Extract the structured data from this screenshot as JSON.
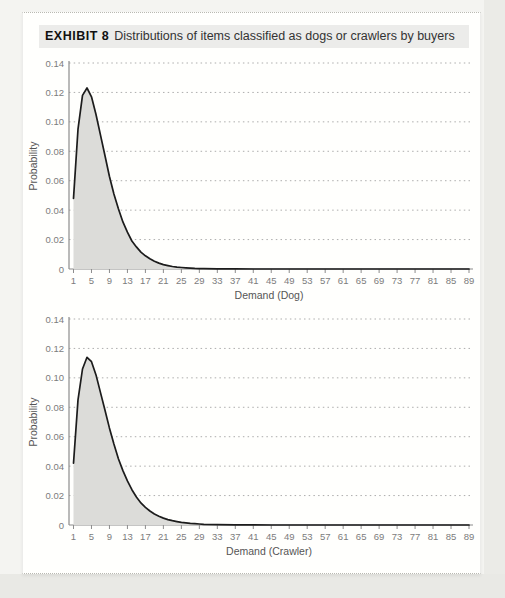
{
  "page": {
    "background": "#f4f4f1",
    "card_background": "#fffffd",
    "margin_band_color": "#e9e9e5"
  },
  "header": {
    "exhibit_label": "EXHIBIT 8",
    "title_rest": "Distributions of items classified as dogs or crawlers by buyers",
    "highlight_color": "#ececea"
  },
  "chart_data": [
    {
      "type": "area",
      "name": "dog-distribution",
      "xlabel": "Demand (Dog)",
      "ylabel": "Probability",
      "xlim": [
        0,
        89
      ],
      "ylim": [
        0,
        0.14
      ],
      "grid": "dotted-horizontal",
      "legend": "none",
      "x_ticks": [
        1,
        5,
        9,
        13,
        17,
        21,
        25,
        29,
        33,
        37,
        41,
        45,
        49,
        53,
        57,
        61,
        65,
        69,
        73,
        77,
        81,
        85,
        89
      ],
      "y_ticks": [
        0,
        0.02,
        0.04,
        0.06,
        0.08,
        0.1,
        0.12,
        0.14
      ],
      "y_tick_labels": [
        "0",
        "0.02",
        "0.04",
        "0.06",
        "0.08",
        "0.10",
        "0.12",
        "0.14"
      ],
      "x": [
        1,
        2,
        3,
        4,
        5,
        6,
        7,
        8,
        9,
        10,
        11,
        12,
        13,
        14,
        15,
        16,
        17,
        18,
        19,
        20,
        21,
        22,
        23,
        24,
        25,
        26,
        27,
        28,
        29,
        30,
        33,
        37,
        41,
        45,
        53,
        61,
        69,
        77,
        85,
        89
      ],
      "values": [
        0.048,
        0.095,
        0.118,
        0.123,
        0.117,
        0.105,
        0.091,
        0.077,
        0.063,
        0.051,
        0.041,
        0.032,
        0.025,
        0.019,
        0.015,
        0.0115,
        0.009,
        0.007,
        0.0053,
        0.004,
        0.003,
        0.0023,
        0.0017,
        0.0013,
        0.001,
        0.0008,
        0.0006,
        0.0004,
        0.0003,
        0.0002,
        0.0001,
        0.0001,
        0,
        0,
        0,
        0,
        0,
        0,
        0,
        0
      ],
      "line_color": "#1c1c1c",
      "fill_color": "#dcdcd9",
      "axis_color": "#8c8c8c",
      "grid_color": "#adadad"
    },
    {
      "type": "area",
      "name": "crawler-distribution",
      "xlabel": "Demand (Crawler)",
      "ylabel": "Probability",
      "xlim": [
        0,
        89
      ],
      "ylim": [
        0,
        0.14
      ],
      "grid": "dotted-horizontal",
      "legend": "none",
      "x_ticks": [
        1,
        5,
        9,
        13,
        17,
        21,
        25,
        29,
        33,
        37,
        41,
        45,
        49,
        53,
        57,
        61,
        65,
        69,
        73,
        77,
        81,
        85,
        89
      ],
      "y_ticks": [
        0,
        0.02,
        0.04,
        0.06,
        0.08,
        0.1,
        0.12,
        0.14
      ],
      "y_tick_labels": [
        "0",
        "0.02",
        "0.04",
        "0.06",
        "0.08",
        "0.10",
        "0.12",
        "0.14"
      ],
      "x": [
        1,
        2,
        3,
        4,
        5,
        6,
        7,
        8,
        9,
        10,
        11,
        12,
        13,
        14,
        15,
        16,
        17,
        18,
        19,
        20,
        21,
        22,
        23,
        24,
        25,
        26,
        27,
        28,
        29,
        30,
        33,
        37,
        41,
        45,
        53,
        61,
        69,
        77,
        85,
        89
      ],
      "values": [
        0.042,
        0.085,
        0.106,
        0.114,
        0.111,
        0.102,
        0.09,
        0.078,
        0.066,
        0.055,
        0.045,
        0.037,
        0.03,
        0.024,
        0.019,
        0.015,
        0.012,
        0.0095,
        0.0075,
        0.006,
        0.0047,
        0.0037,
        0.0029,
        0.0023,
        0.0018,
        0.0014,
        0.0011,
        0.0009,
        0.0007,
        0.0005,
        0.0003,
        0.0001,
        0.0001,
        0,
        0,
        0,
        0,
        0,
        0,
        0
      ],
      "line_color": "#1c1c1c",
      "fill_color": "#dcdcd9",
      "axis_color": "#8c8c8c",
      "grid_color": "#adadad"
    }
  ]
}
